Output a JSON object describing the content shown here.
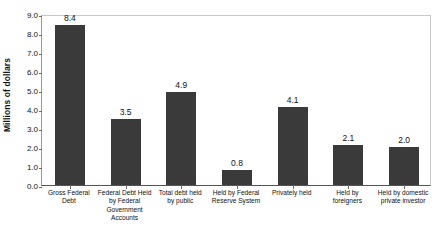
{
  "chart_data": {
    "type": "bar",
    "title": "",
    "xlabel": "",
    "ylabel": "Millions of dollars",
    "ylim": [
      0.0,
      9.0
    ],
    "ystep": 1.0,
    "grid": false,
    "legend": null,
    "bar_color": "#3a3a3a",
    "categories": [
      "Gross Federal Debt",
      "Federal Debt Held by Federal Government Accounts",
      "Total debt held by public",
      "Held by Federal Reserve System",
      "Privately held",
      "Held by foreigners",
      "Held by domestic private investor"
    ],
    "category_lines": [
      [
        "Gross Federal",
        "Debt"
      ],
      [
        "Federal Debt Held",
        "by Federal",
        "Government",
        "Accounts"
      ],
      [
        "Total debt held",
        "by public"
      ],
      [
        "Held by Federal",
        "Reserve System"
      ],
      [
        "Privately held"
      ],
      [
        "Held by",
        "foreigners"
      ],
      [
        "Held by domestic",
        "private investor"
      ]
    ],
    "values": [
      8.4,
      3.5,
      4.9,
      0.8,
      4.1,
      2.1,
      2.0
    ],
    "value_labels": [
      "8.4",
      "3.5",
      "4.9",
      "0.8",
      "4.1",
      "2.1",
      "2.0"
    ],
    "ytick_labels": [
      "9.0",
      "8.0",
      "7.0",
      "6.0",
      "5.0",
      "4.0",
      "3.0",
      "2.0",
      "1.0",
      "0.0"
    ],
    "ytick_values": [
      9.0,
      8.0,
      7.0,
      6.0,
      5.0,
      4.0,
      3.0,
      2.0,
      1.0,
      0.0
    ]
  }
}
